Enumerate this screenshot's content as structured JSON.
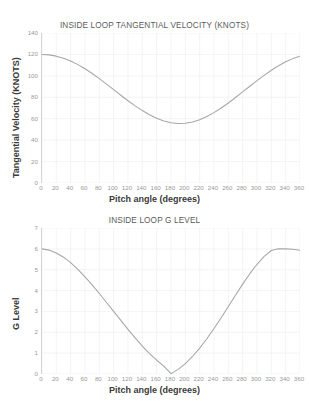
{
  "chart_data": [
    {
      "type": "line",
      "title": "INSIDE LOOP TANGENTIAL VELOCITY (KNOTS)",
      "xlabel": "Pitch angle (degrees)",
      "ylabel": "Tangential Velocity (KNOTS)",
      "xlim": [
        0,
        360
      ],
      "ylim": [
        0,
        140
      ],
      "xticks": [
        0,
        20,
        40,
        60,
        80,
        100,
        120,
        140,
        160,
        180,
        200,
        220,
        240,
        260,
        280,
        300,
        320,
        340,
        360
      ],
      "yticks": [
        0,
        20,
        40,
        60,
        80,
        100,
        120,
        140
      ],
      "grid": true,
      "legend": "none",
      "line_color": "#a6a6a6",
      "x": [
        0,
        10,
        20,
        30,
        40,
        50,
        60,
        70,
        80,
        90,
        100,
        110,
        120,
        130,
        140,
        150,
        160,
        170,
        180,
        190,
        200,
        210,
        220,
        230,
        240,
        250,
        260,
        270,
        280,
        290,
        300,
        310,
        320,
        330,
        340,
        350,
        360
      ],
      "values": [
        120.0,
        119.6,
        118.4,
        116.5,
        113.8,
        110.5,
        106.6,
        102.2,
        97.4,
        92.3,
        87.1,
        81.9,
        76.8,
        72.0,
        67.6,
        63.7,
        60.4,
        57.9,
        56.2,
        55.5,
        55.7,
        56.9,
        59.0,
        62.0,
        65.7,
        70.0,
        74.7,
        79.8,
        85.0,
        90.3,
        95.5,
        100.5,
        105.2,
        109.4,
        113.1,
        116.1,
        118.4
      ]
    },
    {
      "type": "line",
      "title": "INSIDE LOOP G LEVEL",
      "xlabel": "Pitch angle (degrees)",
      "ylabel": "G Level",
      "xlim": [
        0,
        360
      ],
      "ylim": [
        0,
        7
      ],
      "xticks": [
        0,
        20,
        40,
        60,
        80,
        100,
        120,
        140,
        160,
        180,
        200,
        220,
        240,
        260,
        280,
        300,
        320,
        340,
        360
      ],
      "yticks": [
        0,
        1,
        2,
        3,
        4,
        5,
        6,
        7
      ],
      "grid": true,
      "legend": "none",
      "line_color": "#a6a6a6",
      "x": [
        0,
        10,
        20,
        30,
        40,
        50,
        60,
        70,
        80,
        90,
        100,
        110,
        120,
        130,
        140,
        150,
        160,
        170,
        180,
        190,
        200,
        210,
        220,
        230,
        240,
        250,
        260,
        270,
        280,
        290,
        300,
        310,
        320,
        330,
        340,
        350,
        360
      ],
      "values": [
        6.0,
        5.94,
        5.8,
        5.6,
        5.34,
        5.02,
        4.66,
        4.27,
        3.86,
        3.43,
        3.0,
        2.57,
        2.14,
        1.73,
        1.34,
        0.98,
        0.66,
        0.38,
        0.02,
        0.22,
        0.5,
        0.84,
        1.24,
        1.69,
        2.18,
        2.7,
        3.24,
        3.78,
        4.31,
        4.81,
        5.26,
        5.64,
        5.92,
        6.0,
        6.0,
        5.98,
        5.93
      ]
    }
  ]
}
